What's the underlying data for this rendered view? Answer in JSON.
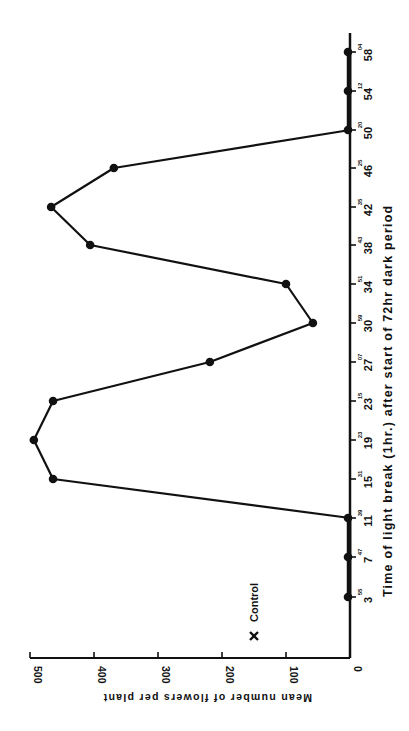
{
  "chart_data": {
    "type": "line",
    "orientation": "rotated-90-ccw",
    "title": "",
    "xlabel": "Time of light break (1hr.) after start of 72hr dark period",
    "ylabel": "Mean number of flowers per plant",
    "x_tick_labels": [
      {
        "main": "3",
        "sup": "55"
      },
      {
        "main": "7",
        "sup": "47"
      },
      {
        "main": "11",
        "sup": "39"
      },
      {
        "main": "15",
        "sup": "31"
      },
      {
        "main": "19",
        "sup": "23"
      },
      {
        "main": "23",
        "sup": "15"
      },
      {
        "main": "27",
        "sup": "07"
      },
      {
        "main": "30",
        "sup": "59"
      },
      {
        "main": "34",
        "sup": "51"
      },
      {
        "main": "38",
        "sup": "43"
      },
      {
        "main": "42",
        "sup": "35"
      },
      {
        "main": "46",
        "sup": "25"
      },
      {
        "main": "50",
        "sup": "20"
      },
      {
        "main": "54",
        "sup": "12"
      },
      {
        "main": "58",
        "sup": "04"
      }
    ],
    "y_ticks": [
      0,
      100,
      200,
      300,
      400,
      500
    ],
    "ylim": [
      0,
      500
    ],
    "grid": false,
    "series": [
      {
        "name": "Light break",
        "x": [
          "3",
          "7",
          "11",
          "15",
          "19",
          "23",
          "27",
          "30",
          "34",
          "38",
          "42",
          "46",
          "50",
          "54",
          "58"
        ],
        "values": [
          0,
          0,
          0,
          464,
          494,
          464,
          219,
          58,
          100,
          406,
          467,
          369,
          0,
          0,
          0
        ]
      }
    ],
    "annotations": [
      {
        "label": "Control",
        "marker": "x",
        "value": 150
      }
    ]
  }
}
